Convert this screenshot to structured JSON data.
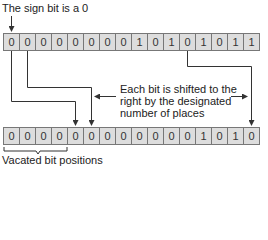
{
  "title": "The sign bit is a 0",
  "source_bits": [
    "0",
    "0",
    "0",
    "0",
    "0",
    "0",
    "0",
    "0",
    "1",
    "0",
    "1",
    "0",
    "1",
    "0",
    "1",
    "1"
  ],
  "result_bits": [
    "0",
    "0",
    "0",
    "0",
    "0",
    "0",
    "0",
    "0",
    "0",
    "0",
    "0",
    "0",
    "1",
    "0",
    "1",
    "0"
  ],
  "note_lines": [
    "Each bit is shifted to the",
    "right by the designated",
    "number of places"
  ],
  "vacated_label": "Vacated bit positions",
  "shift_places": 4
}
